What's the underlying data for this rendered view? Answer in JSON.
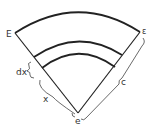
{
  "diagram": {
    "labels": {
      "top_left": "E",
      "top_right": "ε",
      "apex": "e",
      "dx": "dx",
      "x": "x",
      "c": "c"
    },
    "colors": {
      "stroke": "#222222",
      "text": "#333333"
    }
  }
}
